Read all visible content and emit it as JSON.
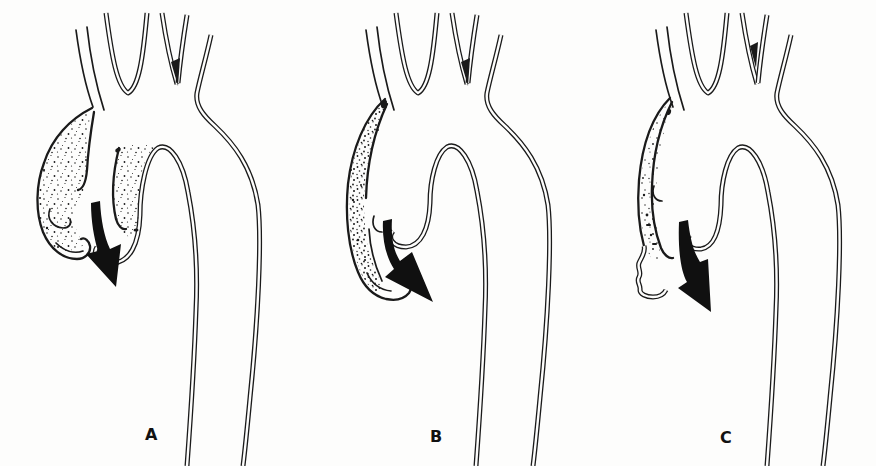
{
  "figure": {
    "type": "medical-line-diagram",
    "background": "#fdfdfc",
    "ink": "#1a1a1a",
    "panels": [
      {
        "label": "A",
        "stipple_region": "large-bilobed-dilated-aortic-root",
        "flow_arrow": "straight-down"
      },
      {
        "label": "B",
        "stipple_region": "narrow-crescent-false-lumen",
        "flow_arrow": "curved-down-right"
      },
      {
        "label": "C",
        "stipple_region": "thin-collapsed-false-lumen-wavy-wall",
        "flow_arrow": "curved-down-right"
      }
    ]
  }
}
